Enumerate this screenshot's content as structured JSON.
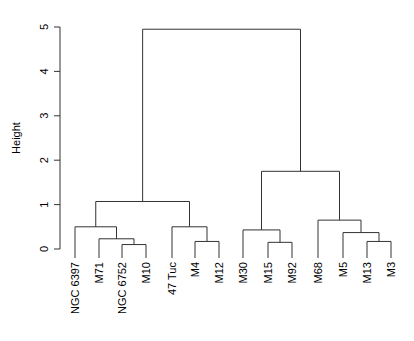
{
  "chart_data": {
    "type": "dendrogram",
    "title": "",
    "xlabel": "",
    "ylabel": "Height",
    "ylim": [
      0,
      5
    ],
    "yticks": [
      0,
      1,
      2,
      3,
      4,
      5
    ],
    "leaves": [
      "NGC 6397",
      "M71",
      "NGC 6752",
      "M10",
      "47 Tuc",
      "M4",
      "M12",
      "M30",
      "M15",
      "M92",
      "M68",
      "M5",
      "M13",
      "M3"
    ],
    "merges": [
      {
        "id": "a",
        "left": "NGC 6752",
        "right": "M10",
        "height": 0.1
      },
      {
        "id": "b",
        "left": "M71",
        "right": "a",
        "height": 0.23
      },
      {
        "id": "c",
        "left": "NGC 6397",
        "right": "b",
        "height": 0.5
      },
      {
        "id": "d",
        "left": "M4",
        "right": "M12",
        "height": 0.17
      },
      {
        "id": "e",
        "left": "47 Tuc",
        "right": "d",
        "height": 0.5
      },
      {
        "id": "f",
        "left": "c",
        "right": "e",
        "height": 1.07
      },
      {
        "id": "g",
        "left": "M15",
        "right": "M92",
        "height": 0.15
      },
      {
        "id": "h",
        "left": "M30",
        "right": "g",
        "height": 0.43
      },
      {
        "id": "i",
        "left": "M13",
        "right": "M3",
        "height": 0.17
      },
      {
        "id": "j",
        "left": "M5",
        "right": "i",
        "height": 0.37
      },
      {
        "id": "k",
        "left": "M68",
        "right": "j",
        "height": 0.65
      },
      {
        "id": "l",
        "left": "h",
        "right": "k",
        "height": 1.75
      },
      {
        "id": "root",
        "left": "f",
        "right": "l",
        "height": 4.95
      }
    ],
    "grid": false,
    "legend": null
  }
}
